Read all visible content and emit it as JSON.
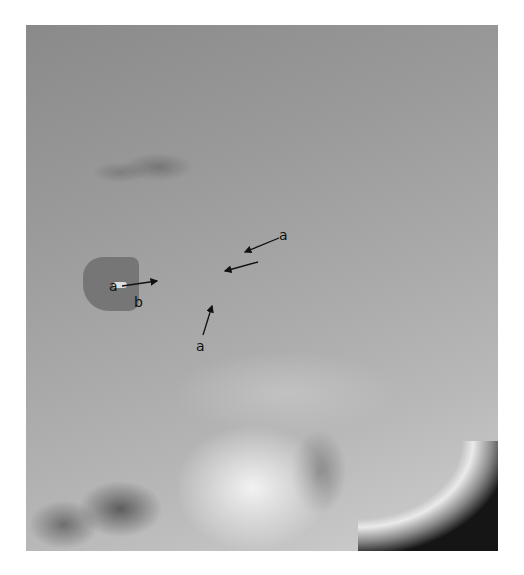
{
  "image": {
    "type": "lateral skull radiograph",
    "colors": {
      "background": "#ffffff",
      "bone": "#f2f2f2",
      "soft": "#9a9a9a",
      "air": "#0c0c0c"
    }
  },
  "annotations": [
    {
      "id": "label-a-top-right",
      "text": "a",
      "x": 284,
      "y": 262
    },
    {
      "id": "label-a-left",
      "text": "a",
      "x": 114,
      "y": 287
    },
    {
      "id": "label-b",
      "text": "b",
      "x": 139,
      "y": 304
    },
    {
      "id": "label-a-bottom",
      "text": "a",
      "x": 201,
      "y": 349
    }
  ]
}
